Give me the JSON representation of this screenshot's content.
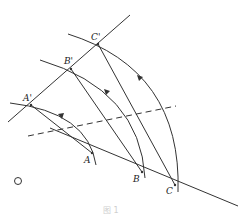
{
  "diagram": {
    "type": "geometric-construction",
    "colors": {
      "stroke": "#333333",
      "background": "#ffffff"
    },
    "points": {
      "A": {
        "label": "A",
        "x": 92,
        "y": 153
      },
      "B": {
        "label": "B",
        "x": 142,
        "y": 172
      },
      "C": {
        "label": "C",
        "x": 175,
        "y": 185
      },
      "A_prime": {
        "label": "A'",
        "x": 31,
        "y": 105
      },
      "B_prime": {
        "label": "B'",
        "x": 71,
        "y": 69
      },
      "C_prime": {
        "label": "C'",
        "x": 98,
        "y": 44
      },
      "O": {
        "label": "O",
        "x": 18,
        "y": 181
      }
    },
    "lines": [
      {
        "name": "original-line",
        "from": [
          50,
          128
        ],
        "to": [
          238,
          206
        ],
        "style": "solid"
      },
      {
        "name": "image-line",
        "from": [
          8,
          122
        ],
        "to": [
          130,
          15
        ],
        "style": "solid"
      },
      {
        "name": "segment-AA'",
        "from": [
          31,
          105
        ],
        "to": [
          92,
          153
        ],
        "style": "solid"
      },
      {
        "name": "segment-BB'",
        "from": [
          71,
          69
        ],
        "to": [
          142,
          172
        ],
        "style": "solid"
      },
      {
        "name": "segment-CC'",
        "from": [
          98,
          44
        ],
        "to": [
          175,
          185
        ],
        "style": "solid"
      },
      {
        "name": "bisector",
        "from": [
          28,
          136
        ],
        "to": [
          176,
          106
        ],
        "style": "dashed"
      }
    ],
    "arcs": [
      {
        "name": "arc-A",
        "from": "A",
        "to": "A'",
        "arrow": "toward A'"
      },
      {
        "name": "arc-B",
        "from": "B",
        "to": "B'",
        "arrow": "toward B'"
      },
      {
        "name": "arc-C",
        "from": "C",
        "to": "C'",
        "arrow": "toward C'"
      }
    ],
    "caption": "图 1"
  }
}
